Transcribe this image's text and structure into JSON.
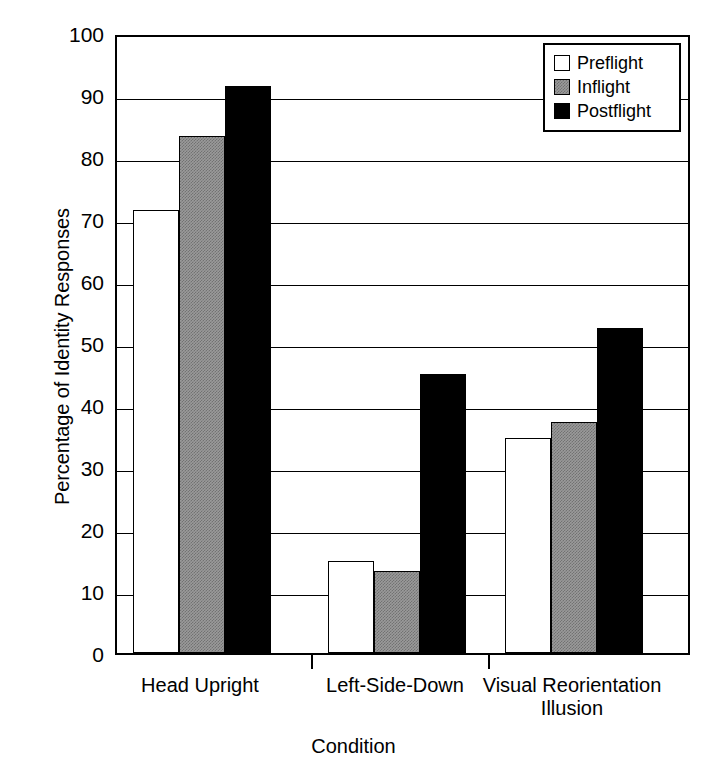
{
  "chart_data": {
    "type": "bar",
    "title": "",
    "xlabel": "Condition",
    "ylabel": "Percentage of Identity Responses",
    "ylim": [
      0,
      100
    ],
    "ytick_step": 10,
    "yticks": [
      0,
      10,
      20,
      30,
      40,
      50,
      60,
      70,
      80,
      90,
      100
    ],
    "ytick_labels": [
      "0",
      "10",
      "20",
      "30",
      "40",
      "50",
      "60",
      "70",
      "80",
      "90",
      "100"
    ],
    "grid": "horizontal",
    "categories": [
      "Head Upright",
      "Left-Side-Down",
      "Visual Reorientation Illusion"
    ],
    "category_label_lines": [
      [
        "Head Upright"
      ],
      [
        "Left-Side-Down"
      ],
      [
        "Visual Reorientation",
        "Illusion"
      ]
    ],
    "legend_position": "top-right",
    "series": [
      {
        "name": "Preflight",
        "fill": "#ffffff",
        "pattern": "solid",
        "values": [
          71.5,
          14.9,
          34.6
        ]
      },
      {
        "name": "Inflight",
        "fill": "#9a9a9a",
        "pattern": "hatched-gray",
        "values": [
          83.4,
          13.3,
          37.2
        ]
      },
      {
        "name": "Postflight",
        "fill": "#000000",
        "pattern": "solid",
        "values": [
          91.5,
          45.0,
          52.5
        ]
      }
    ]
  },
  "colors": {
    "axis": "#000000",
    "grid": "#000000",
    "background": "#ffffff",
    "preflight": "#ffffff",
    "inflight": "#9a9a9a",
    "postflight": "#000000"
  }
}
